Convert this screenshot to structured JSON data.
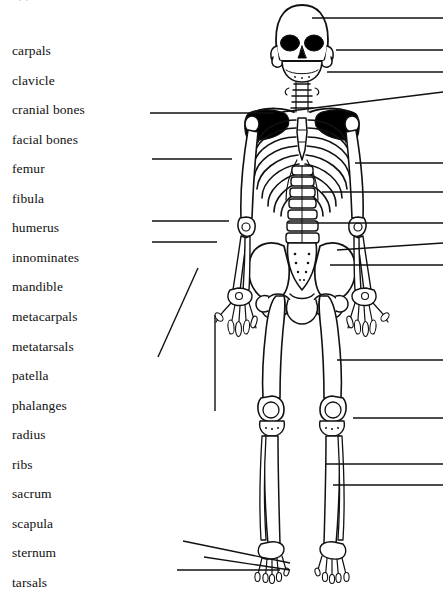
{
  "page": {
    "width": 445,
    "height": 597,
    "background": "#ffffff",
    "ink": "#111111",
    "cropped_header_text": "· ·"
  },
  "word_bank": {
    "name": "bone-term-word-bank",
    "x": 12,
    "first_y": 44,
    "line_spacing": 29.55,
    "terms": [
      "carpals",
      "clavicle",
      "cranial bones",
      "facial bones",
      "femur",
      "fibula",
      "humerus",
      "innominates",
      "mandible",
      "metacarpals",
      "metatarsals",
      "patella",
      "phalanges",
      "radius",
      "ribs",
      "sacrum",
      "scapula",
      "sternum",
      "tarsals",
      "tibia",
      "ulna",
      "vertebrae"
    ]
  },
  "diagram": {
    "name": "human-skeleton-anterior-view",
    "caption": "",
    "stroke": "#111111",
    "fill": "#ffffff",
    "shadow_fill": "#000000"
  },
  "leader_lines": {
    "stroke": "#111111",
    "stroke_width": 1.4,
    "left": [
      {
        "id": "left-1",
        "x1": 150,
        "y1": 113,
        "x2": 274,
        "y2": 113
      },
      {
        "id": "left-2",
        "x1": 152,
        "y1": 159,
        "x2": 232,
        "y2": 159
      },
      {
        "id": "left-3",
        "x1": 152,
        "y1": 221,
        "x2": 229,
        "y2": 221
      },
      {
        "id": "left-4",
        "x1": 152,
        "y1": 242,
        "x2": 217,
        "y2": 242
      },
      {
        "id": "left-5",
        "x1": 158,
        "y1": 357,
        "x2": 198,
        "y2": 268
      },
      {
        "id": "left-6",
        "x1": 215,
        "y1": 411,
        "x2": 215,
        "y2": 315
      },
      {
        "id": "left-7",
        "x1": 183,
        "y1": 541,
        "x2": 290,
        "y2": 563
      },
      {
        "id": "left-8",
        "x1": 204,
        "y1": 557,
        "x2": 290,
        "y2": 570
      },
      {
        "id": "left-9",
        "x1": 177,
        "y1": 570,
        "x2": 280,
        "y2": 570
      }
    ],
    "right": [
      {
        "id": "right-1",
        "x1": 312,
        "y1": 18,
        "x2": 443,
        "y2": 18
      },
      {
        "id": "right-2",
        "x1": 336,
        "y1": 50,
        "x2": 443,
        "y2": 50
      },
      {
        "id": "right-3",
        "x1": 327,
        "y1": 72,
        "x2": 443,
        "y2": 72
      },
      {
        "id": "right-4",
        "x1": 282,
        "y1": 112,
        "x2": 443,
        "y2": 92
      },
      {
        "id": "right-5",
        "x1": 355,
        "y1": 163,
        "x2": 443,
        "y2": 163
      },
      {
        "id": "right-6",
        "x1": 322,
        "y1": 192,
        "x2": 443,
        "y2": 192
      },
      {
        "id": "right-7",
        "x1": 288,
        "y1": 223,
        "x2": 443,
        "y2": 223
      },
      {
        "id": "right-8",
        "x1": 337,
        "y1": 250,
        "x2": 443,
        "y2": 243
      },
      {
        "id": "right-9",
        "x1": 330,
        "y1": 265,
        "x2": 443,
        "y2": 265
      },
      {
        "id": "right-10",
        "x1": 337,
        "y1": 360,
        "x2": 443,
        "y2": 360
      },
      {
        "id": "right-11",
        "x1": 353,
        "y1": 418,
        "x2": 443,
        "y2": 418
      },
      {
        "id": "right-12",
        "x1": 325,
        "y1": 464,
        "x2": 443,
        "y2": 464
      },
      {
        "id": "right-13",
        "x1": 333,
        "y1": 485,
        "x2": 443,
        "y2": 485
      }
    ]
  }
}
